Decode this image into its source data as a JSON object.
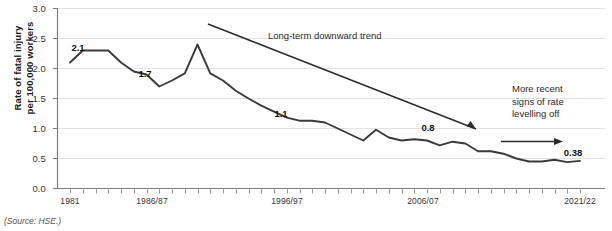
{
  "source_note": "(Source: HSE.)",
  "axes": {
    "y_title_line1": "Rate of fatal injury",
    "y_title_line2": "per 100,000 workers",
    "y_ticks": [
      "3.0",
      "2.5",
      "2.0",
      "1.5",
      "1.0",
      "0.5",
      "0.0"
    ],
    "x_ticks": [
      "1981",
      "1986/87",
      "1996/97",
      "2006/07",
      "2021/22"
    ]
  },
  "annotations": {
    "trend": "Long-term downward trend",
    "levelling_line1": "More recent",
    "levelling_line2": "signs of rate",
    "levelling_line3": "levelling off"
  },
  "data_labels": [
    {
      "text": "2.1",
      "x": 78,
      "y": 47
    },
    {
      "text": "1.7",
      "x": 145,
      "y": 73
    },
    {
      "text": "1.1",
      "x": 281,
      "y": 113
    },
    {
      "text": "0.8",
      "x": 428,
      "y": 127
    },
    {
      "text": "0.38",
      "x": 573,
      "y": 152
    }
  ],
  "chart_data": {
    "type": "line",
    "title": "",
    "xlabel": "",
    "ylabel": "Rate of fatal injury per 100,000 workers",
    "ylim": [
      0.0,
      3.0
    ],
    "yticks": [
      0.0,
      0.5,
      1.0,
      1.5,
      2.0,
      2.5,
      3.0
    ],
    "grid": true,
    "legend": "none",
    "xtick_labels": [
      "1981",
      "1986/87",
      "1996/97",
      "2006/07",
      "2021/22"
    ],
    "xtick_indices": [
      0,
      6,
      16,
      26,
      41
    ],
    "x": [
      "1981",
      "1982",
      "1983",
      "1984",
      "1985",
      "1986/87",
      "1987/88",
      "1988/89",
      "1989/90",
      "1990/91",
      "1991/92",
      "1992/93",
      "1993/94",
      "1994/95",
      "1995/96",
      "1996/97",
      "1997/98",
      "1998/99",
      "1999/00",
      "2000/01",
      "2001/02",
      "2002/03",
      "2003/04",
      "2004/05",
      "2005/06",
      "2006/07",
      "2007/08",
      "2008/09",
      "2009/10",
      "2010/11",
      "2011/12",
      "2012/13",
      "2013/14",
      "2014/15",
      "2015/16",
      "2016/17",
      "2017/18",
      "2018/19",
      "2019/20",
      "2020/21",
      "2021/22"
    ],
    "series": [
      {
        "name": "Rate of fatal injury per 100,000 workers",
        "color": "#3a3a3a",
        "values": [
          2.1,
          2.3,
          2.3,
          2.3,
          2.1,
          1.95,
          1.9,
          1.7,
          1.8,
          1.92,
          2.4,
          1.92,
          1.8,
          1.63,
          1.5,
          1.38,
          1.28,
          1.18,
          1.13,
          1.13,
          1.1,
          1.0,
          0.9,
          0.8,
          0.98,
          0.85,
          0.8,
          0.82,
          0.8,
          0.72,
          0.78,
          0.75,
          0.62,
          0.62,
          0.58,
          0.5,
          0.45,
          0.45,
          0.48,
          0.44,
          0.46
        ]
      }
    ],
    "annotation_arrows": [
      {
        "label": "Long-term downward trend",
        "from": [
          208,
          24
        ],
        "to": [
          480,
          131
        ]
      },
      {
        "label": "More recent signs of rate levelling off",
        "from": [
          502,
          141
        ],
        "to": [
          562,
          141
        ]
      }
    ]
  }
}
